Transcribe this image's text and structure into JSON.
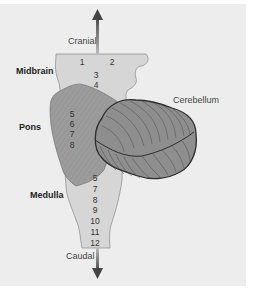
{
  "diagram": {
    "type": "anatomical-brainstem",
    "colors": {
      "background": "#ededed",
      "midbrain_medulla_fill": "#d6d6d6",
      "pons_fill": "#9a9a9a",
      "cerebellum_fill": "#8c8c8c",
      "outline": "#333333",
      "arrow": "#555555"
    },
    "axis": {
      "top_label": "Cranial",
      "bottom_label": "Caudal"
    },
    "regions": {
      "midbrain": "Midbrain",
      "pons": "Pons",
      "medulla": "Medulla",
      "cerebellum": "Cerebellum"
    },
    "nerve_numbers": {
      "midbrain": [
        "1",
        "2",
        "3",
        "4"
      ],
      "pons": [
        "5",
        "6",
        "7",
        "8"
      ],
      "medulla": [
        "5",
        "7",
        "8",
        "9",
        "10",
        "11",
        "12"
      ]
    }
  }
}
